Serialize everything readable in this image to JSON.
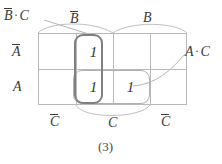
{
  "figure": {
    "caption": "(3)",
    "type": "karnaugh-map",
    "rows": 2,
    "cols": 4,
    "grid": {
      "x": 38,
      "y": 33,
      "width": 149,
      "height": 72,
      "line_color": "#b9b9b9"
    }
  },
  "labels": {
    "top_left_group": {
      "base": "B",
      "overline": true,
      "operator": "·",
      "second": "C",
      "text": "B̄·C"
    },
    "top_not_b": {
      "base": "B",
      "overline": true,
      "text": "B̄"
    },
    "top_b": {
      "base": "B",
      "overline": false,
      "text": "B"
    },
    "left_not_a": {
      "base": "A",
      "overline": true,
      "text": "Ā"
    },
    "left_a": {
      "base": "A",
      "overline": false,
      "text": "A"
    },
    "right_group": {
      "base": "A",
      "overline": false,
      "operator": "·",
      "second": "C",
      "text": "A·C"
    },
    "bottom_not_c_left": {
      "base": "C",
      "overline": true,
      "text": "C̄"
    },
    "bottom_c": {
      "base": "C",
      "overline": false,
      "text": "C"
    },
    "bottom_not_c_right": {
      "base": "C",
      "overline": true,
      "text": "C̄"
    }
  },
  "cells": [
    {
      "row": 0,
      "col": 0,
      "value": ""
    },
    {
      "row": 0,
      "col": 1,
      "value": "1"
    },
    {
      "row": 0,
      "col": 2,
      "value": ""
    },
    {
      "row": 0,
      "col": 3,
      "value": ""
    },
    {
      "row": 1,
      "col": 0,
      "value": ""
    },
    {
      "row": 1,
      "col": 1,
      "value": "1"
    },
    {
      "row": 1,
      "col": 2,
      "value": "1"
    },
    {
      "row": 1,
      "col": 3,
      "value": ""
    }
  ],
  "groups": [
    {
      "name": "not-b-and-c",
      "label": "B̄·C",
      "color": "#808080",
      "style": "dark",
      "cells": [
        [
          0,
          1
        ],
        [
          1,
          1
        ]
      ]
    },
    {
      "name": "a-and-c",
      "label": "A·C",
      "color": "#b0b0b0",
      "style": "light",
      "cells": [
        [
          1,
          1
        ],
        [
          1,
          2
        ]
      ]
    }
  ],
  "colors": {
    "grid_line": "#b9b9b9",
    "group_dark": "#808080",
    "group_light": "#b0b0b0",
    "brace": "#b9b9b9",
    "text": "#3a3a3a"
  }
}
